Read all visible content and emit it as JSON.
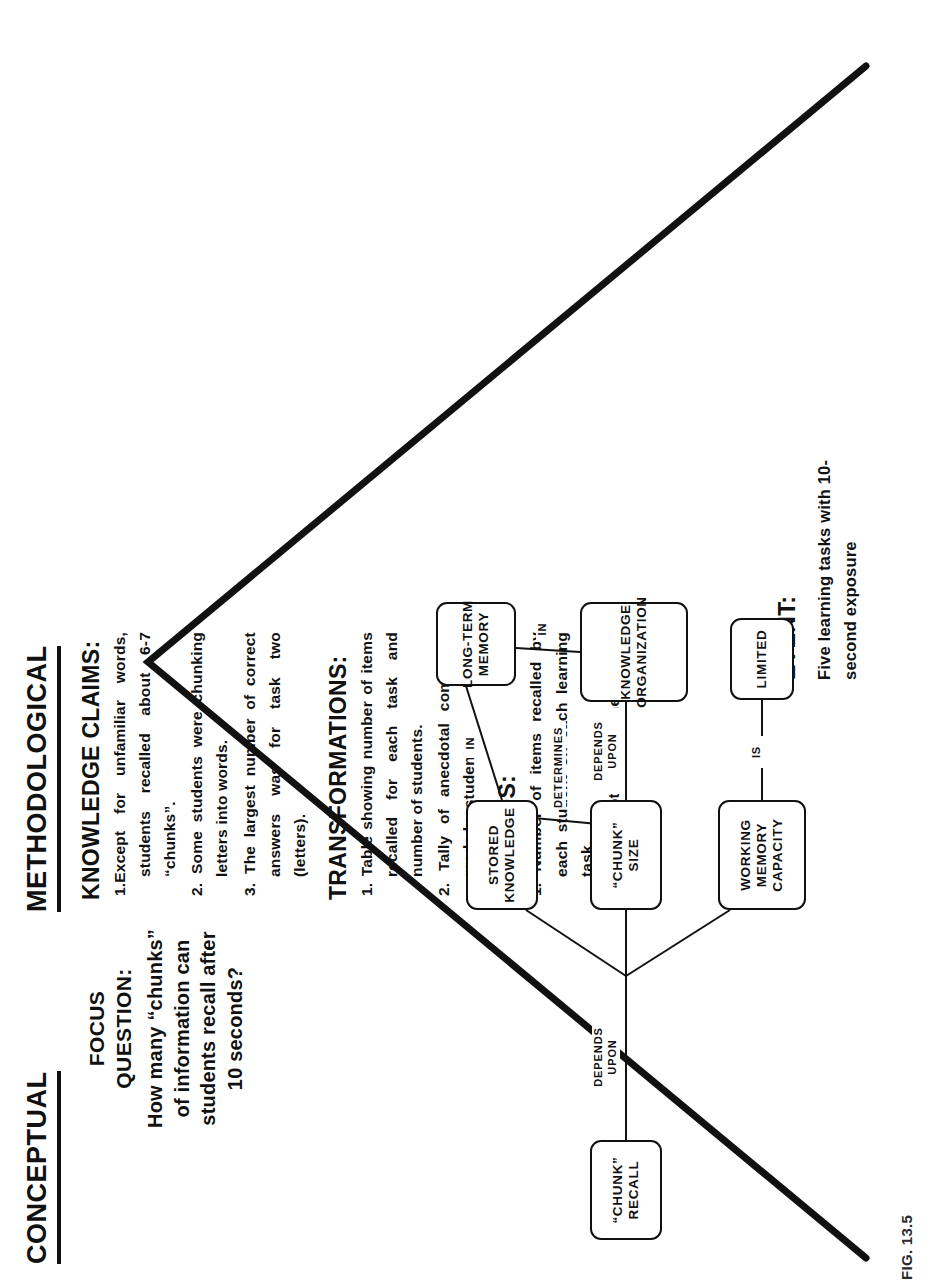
{
  "figure": {
    "caption": "FIG. 13.5"
  },
  "banners": {
    "conceptual": "CONCEPTUAL",
    "methodological": "METHODOLOGICAL"
  },
  "focus": {
    "label_line1": "FOCUS",
    "label_line2": "QUESTION:",
    "text": "How many “chunks” of information can students recall after 10 seconds?"
  },
  "event": {
    "label": "EVENT:",
    "text": "Five learning tasks with 10-second exposure"
  },
  "methodological": {
    "knowledge_claims": {
      "heading": "KNOWLEDGE CLAIMS:",
      "items": [
        "1.Except for unfamiliar words, students recalled about 6-7 “chunks”.",
        "2. Some students were chunking letters into words.",
        "3. The largest number of correct answers was for task two (letters)."
      ]
    },
    "transformations": {
      "heading": "TRANSFORMATIONS:",
      "items": [
        "1. Table showing number of items recalled for each task and number of students.",
        "2. Tally of anecdotal comments made by students."
      ]
    },
    "records": {
      "heading": "RECORDS:",
      "items": [
        "1. Number of items recalled by each student on each learning task.",
        "2. Anecdotal comments of students."
      ]
    }
  },
  "concept_map": {
    "nodes": [
      {
        "id": "chunk-recall",
        "lines": [
          "“CHUNK”",
          "RECALL"
        ]
      },
      {
        "id": "stored-knowledge",
        "lines": [
          "STORED",
          "KNOWLEDGE"
        ]
      },
      {
        "id": "chunk-size",
        "lines": [
          "“CHUNK”",
          "SIZE"
        ]
      },
      {
        "id": "working-memory-capacity",
        "lines": [
          "WORKING",
          "MEMORY",
          "CAPACITY"
        ]
      },
      {
        "id": "long-term-memory",
        "lines": [
          "LONG-TERM",
          "MEMORY"
        ]
      },
      {
        "id": "knowledge-organization",
        "lines": [
          "KNOWLEDGE",
          "ORGANIZATION"
        ]
      },
      {
        "id": "limited",
        "lines": [
          "LIMITED"
        ]
      }
    ],
    "links": [
      {
        "id": "depends-upon-main",
        "lines": [
          "DEPENDS",
          "UPON"
        ]
      },
      {
        "id": "determines",
        "lines": [
          "DETERMINES"
        ]
      },
      {
        "id": "in-stored-ltm",
        "lines": [
          "IN"
        ]
      },
      {
        "id": "depends-upon-size",
        "lines": [
          "DEPENDS",
          "UPON"
        ]
      },
      {
        "id": "in-ltm-org",
        "lines": [
          "IN"
        ]
      },
      {
        "id": "is",
        "lines": [
          "IS"
        ]
      }
    ]
  }
}
